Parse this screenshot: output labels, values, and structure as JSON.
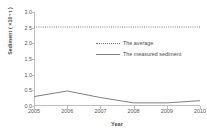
{
  "chart_data": {
    "type": "line",
    "title": "",
    "xlabel": "Year",
    "ylabel": "Sediment ( ×10⁴ t )",
    "x": [
      2005,
      2006,
      2007,
      2008,
      2009,
      2010
    ],
    "xticklabels": [
      "2005",
      "2006",
      "2007",
      "2008",
      "2009",
      "2010"
    ],
    "xlim": [
      2005,
      2010
    ],
    "ylim": [
      0.0,
      3.0
    ],
    "yticks": [
      0.0,
      0.5,
      1.0,
      1.5,
      2.0,
      2.5,
      3.0
    ],
    "yticklabels": [
      "0.0",
      "0.5",
      "1.0",
      "1.5",
      "2.0",
      "2.5",
      "3.0"
    ],
    "grid": false,
    "legend_position": "upper-center-inside",
    "series": [
      {
        "name": "The average",
        "style": "dotted",
        "color": "#7f7f7f",
        "values": [
          2.52,
          2.52,
          2.52,
          2.52,
          2.52,
          2.52
        ]
      },
      {
        "name": "The measured sediment",
        "style": "solid",
        "color": "#808080",
        "values": [
          0.3,
          0.48,
          0.27,
          0.1,
          0.1,
          0.17
        ]
      }
    ]
  },
  "legend": {
    "entries": [
      {
        "label": "The average"
      },
      {
        "label": "The measured sediment"
      }
    ]
  },
  "axes": {
    "x_title": "Year",
    "y_title": "Sediment ( ×10⁴ t )"
  }
}
